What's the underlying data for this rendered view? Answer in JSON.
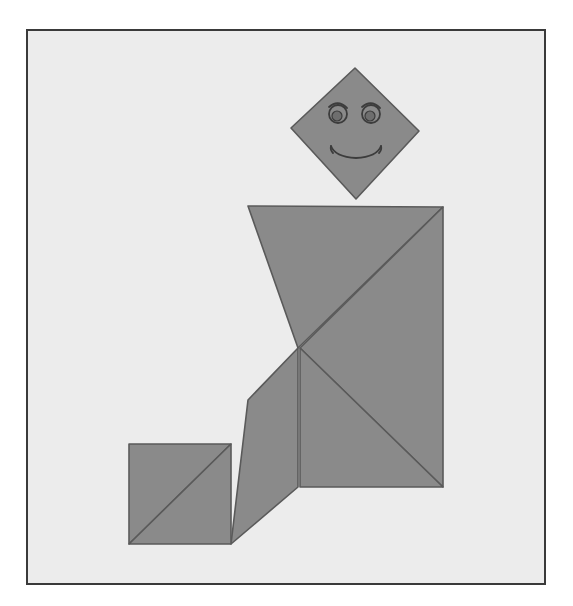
{
  "artwork": {
    "title": "Tangram figure of a seated person",
    "kind": "tangram-puzzle-illustration",
    "canvas": {
      "width": 573,
      "height": 606,
      "background": "#ffffff"
    },
    "frame": {
      "label": "picture-frame",
      "x": 27,
      "y": 30,
      "width": 518,
      "height": 554,
      "fill": "#ececec",
      "stroke": "#3a3a3a",
      "stroke_width": 2
    },
    "palette": {
      "piece_fill": "#8a8a8a",
      "piece_stroke": "#5a5a5a",
      "face_stroke": "#3c3c3c",
      "pupil_fill": "#6e6e6e",
      "background": "#ececec"
    },
    "pieces": [
      {
        "name": "head-square",
        "shape": "square-rotated-45",
        "points": "355,68 419,131 356,199 291,128"
      },
      {
        "name": "torso-large-triangle-upper-left",
        "shape": "triangle",
        "points": "248,206 443,207 298,348"
      },
      {
        "name": "torso-large-triangle-lower-right",
        "shape": "triangle",
        "points": "443,207 443,487 300,348"
      },
      {
        "name": "lap-medium-triangle",
        "shape": "triangle",
        "points": "300,348 443,487 300,487"
      },
      {
        "name": "leg-parallelogram",
        "shape": "parallelogram",
        "points": "298,348 298,487 231,544 248,400"
      },
      {
        "name": "thigh-wedge",
        "shape": "triangle",
        "points": "248,400 231,544 248,460"
      },
      {
        "name": "foot-small-triangle-upper",
        "shape": "triangle",
        "points": "129,444 231,444 129,544"
      },
      {
        "name": "foot-small-triangle-lower",
        "shape": "triangle",
        "points": "231,444 231,544 129,544"
      }
    ],
    "face": {
      "left_eye": {
        "name": "left-eye",
        "cx": 338,
        "cy": 114,
        "r": 9
      },
      "right_eye": {
        "name": "right-eye",
        "cx": 371,
        "cy": 114,
        "r": 9
      },
      "left_pupil": {
        "name": "left-pupil",
        "cx": 337,
        "cy": 116,
        "r": 5
      },
      "right_pupil": {
        "name": "right-pupil",
        "cx": 370,
        "cy": 116,
        "r": 5
      },
      "left_brow": {
        "name": "left-eyebrow",
        "path": "M 329 107 Q 338 99 347 108"
      },
      "right_brow": {
        "name": "right-eyebrow",
        "path": "M 362 107 Q 371 99 380 108"
      },
      "mouth": {
        "name": "smile-mouth",
        "path": "M 331 146 Q 335 157 356 158 Q 377 157 381 146"
      },
      "mouth_left_tip": {
        "name": "mouth-left-tip",
        "path": "M 331 146 Q 330 150 333 153"
      },
      "mouth_right_tip": {
        "name": "mouth-right-tip",
        "path": "M 381 146 Q 382 150 379 153"
      }
    }
  }
}
